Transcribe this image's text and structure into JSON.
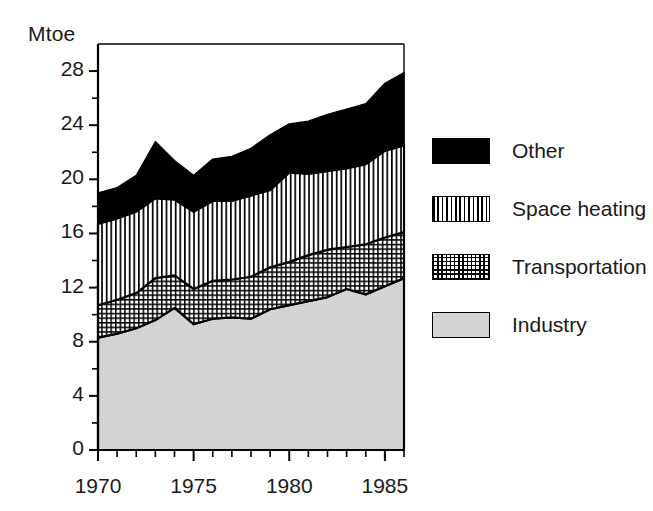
{
  "chart_data": {
    "type": "area",
    "stacked": true,
    "title": "",
    "subtitle": "",
    "xlabel": "",
    "ylabel": "Mtoe",
    "ylim": [
      0,
      30
    ],
    "xlim": [
      1970,
      1986
    ],
    "grid": false,
    "legend_position": "right",
    "y_ticks_major": [
      0,
      4,
      8,
      12,
      16,
      20,
      24,
      28
    ],
    "y_ticks_minor_step": 2,
    "x_tick_labels": [
      "1970",
      "1975",
      "1980",
      "1985"
    ],
    "x_tick_label_values": [
      1970,
      1975,
      1980,
      1985
    ],
    "x_ticks_minor_step": 1,
    "x": [
      1970,
      1971,
      1972,
      1973,
      1974,
      1975,
      1976,
      1977,
      1978,
      1979,
      1980,
      1981,
      1982,
      1983,
      1984,
      1985,
      1986
    ],
    "series": [
      {
        "name": "Industry",
        "fill": "light-gray-solid",
        "color": "#d4d4d4",
        "values": [
          8.3,
          8.6,
          9.0,
          9.6,
          10.5,
          9.3,
          9.7,
          9.8,
          9.7,
          10.4,
          10.7,
          11.0,
          11.3,
          11.9,
          11.5,
          12.1,
          12.7
        ]
      },
      {
        "name": "Transportation",
        "fill": "crosshatch",
        "color": "#ffffff",
        "values": [
          2.4,
          2.5,
          2.6,
          3.1,
          2.4,
          2.6,
          2.8,
          2.8,
          3.1,
          3.1,
          3.2,
          3.4,
          3.5,
          3.1,
          3.7,
          3.6,
          3.4
        ]
      },
      {
        "name": "Space heating",
        "fill": "vertical-lines",
        "color": "#ffffff",
        "values": [
          6.0,
          6.0,
          6.0,
          5.9,
          5.6,
          5.7,
          5.9,
          5.8,
          6.0,
          5.7,
          6.6,
          6.0,
          5.8,
          5.8,
          5.9,
          6.4,
          6.4
        ]
      },
      {
        "name": "Other",
        "fill": "black-solid",
        "color": "#000000",
        "values": [
          2.3,
          2.3,
          2.7,
          4.2,
          2.9,
          2.7,
          3.1,
          3.3,
          3.5,
          4.1,
          3.6,
          3.9,
          4.2,
          4.4,
          4.5,
          5.0,
          5.4
        ]
      }
    ],
    "cumulative_totals": {
      "industry_top": [
        8.3,
        8.6,
        9.0,
        9.6,
        10.5,
        9.3,
        9.7,
        9.8,
        9.7,
        10.4,
        10.7,
        11.0,
        11.3,
        11.9,
        11.5,
        12.1,
        12.7
      ],
      "transportation_top": [
        10.7,
        11.1,
        11.6,
        12.7,
        12.9,
        11.9,
        12.5,
        12.6,
        12.8,
        13.5,
        13.9,
        14.4,
        14.8,
        15.0,
        15.2,
        15.7,
        16.1
      ],
      "space_heating_top": [
        16.7,
        17.1,
        17.6,
        18.6,
        18.5,
        17.6,
        18.4,
        18.4,
        18.8,
        19.2,
        20.5,
        20.4,
        20.6,
        20.8,
        21.1,
        22.1,
        22.5
      ],
      "total": [
        19.0,
        19.4,
        20.3,
        22.8,
        21.4,
        20.3,
        21.5,
        21.7,
        22.3,
        23.3,
        24.1,
        24.3,
        24.8,
        25.2,
        25.6,
        27.1,
        27.9
      ]
    }
  },
  "axis": {
    "y_unit_label": "Mtoe",
    "y_tick_labels": [
      "28",
      "24",
      "20",
      "16",
      "12",
      "8",
      "4",
      "0"
    ],
    "x_tick_labels": [
      "1970",
      "1975",
      "1980",
      "1985"
    ]
  },
  "legend": {
    "items": [
      {
        "label": "Other",
        "swatch": "black-solid"
      },
      {
        "label": "Space heating",
        "swatch": "vertical-lines"
      },
      {
        "label": "Transportation",
        "swatch": "crosshatch"
      },
      {
        "label": "Industry",
        "swatch": "light-gray-solid"
      }
    ]
  }
}
